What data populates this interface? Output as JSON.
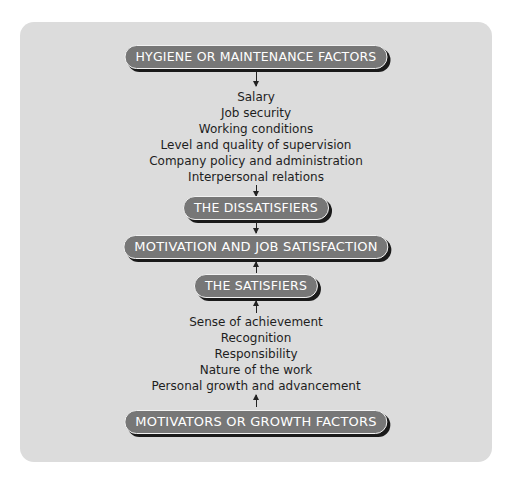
{
  "diagram": {
    "hygiene_header": "HYGIENE OR MAINTENANCE FACTORS",
    "hygiene_items": [
      "Salary",
      "Job security",
      "Working conditions",
      "Level and quality of supervision",
      "Company policy and administration",
      "Interpersonal relations"
    ],
    "dissatisfiers": "THE DISSATISFIERS",
    "center": "MOTIVATION AND JOB SATISFACTION",
    "satisfiers": "THE SATISFIERS",
    "motivator_items": [
      "Sense of achievement",
      "Recognition",
      "Responsibility",
      "Nature of the work",
      "Personal growth and advancement"
    ],
    "motivators_header": "MOTIVATORS OR GROWTH FACTORS"
  }
}
